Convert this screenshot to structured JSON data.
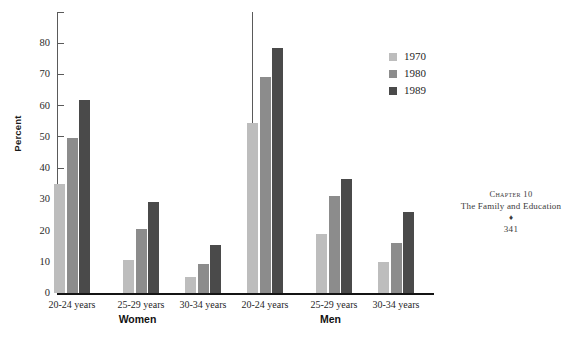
{
  "chart_data": {
    "type": "bar",
    "title": "",
    "xlabel": "",
    "ylabel": "Percent",
    "ylim": [
      0,
      90
    ],
    "yticks": [
      0,
      10,
      20,
      30,
      40,
      50,
      60,
      70,
      80
    ],
    "ytick_labels": [
      "0",
      "10",
      "20",
      "30",
      "40",
      "50",
      "60",
      "70",
      "80"
    ],
    "grid": false,
    "legend_position": "upper-right",
    "groups": [
      "Women",
      "Men"
    ],
    "categories": [
      "20-24 years",
      "25-29 years",
      "30-34 years"
    ],
    "series": [
      {
        "name": "1970",
        "color": "#bdbdbd",
        "values": {
          "Women": [
            35.0,
            10.5,
            5.0
          ],
          "Men": [
            54.5,
            19.0,
            10.0
          ]
        }
      },
      {
        "name": "1980",
        "color": "#8c8c8c",
        "values": {
          "Women": [
            49.8,
            20.4,
            9.4
          ],
          "Men": [
            69.2,
            31.2,
            16.0
          ]
        }
      },
      {
        "name": "1989",
        "color": "#4a4a4a",
        "values": {
          "Women": [
            61.8,
            29.3,
            15.5
          ],
          "Men": [
            78.6,
            36.4,
            26.0
          ]
        }
      }
    ]
  },
  "axis": {
    "y_label": "Percent",
    "y_ticks": [
      "0",
      "10",
      "20",
      "30",
      "40",
      "50",
      "60",
      "70",
      "80"
    ]
  },
  "groups": [
    {
      "label": "Women",
      "categories": [
        "20-24 years",
        "25-29 years",
        "30-34 years"
      ]
    },
    {
      "label": "Men",
      "categories": [
        "20-24 years",
        "25-29 years",
        "30-34 years"
      ]
    }
  ],
  "legend": {
    "items": [
      {
        "label": "1970",
        "color": "#bdbdbd"
      },
      {
        "label": "1980",
        "color": "#8c8c8c"
      },
      {
        "label": "1989",
        "color": "#4a4a4a"
      }
    ]
  },
  "page_footer": {
    "chapter": "Chapter 10",
    "title": "The Family and Education",
    "ornament": "♦",
    "page_number": "341"
  }
}
